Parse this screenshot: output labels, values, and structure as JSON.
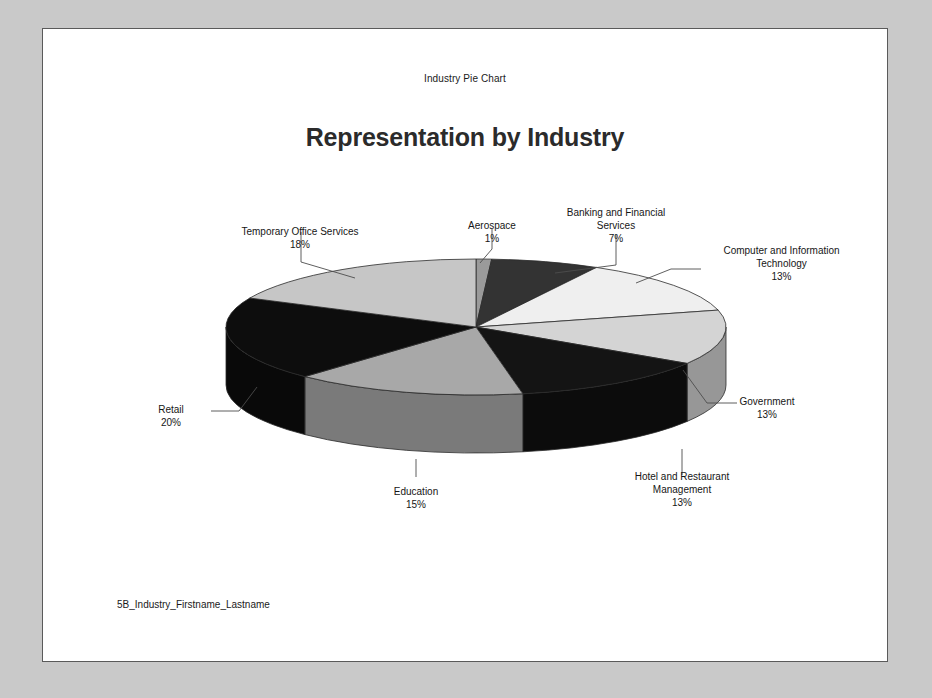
{
  "document": {
    "header": "Industry Pie Chart",
    "title": "Representation by Industry",
    "footer": "5B_Industry_Firstname_Lastname"
  },
  "chart_data": {
    "type": "pie",
    "title": "Representation by Industry",
    "subtitle": "Industry Pie Chart",
    "style": "3d-exploded-disc",
    "legend": "none",
    "labels_show_percent": true,
    "categories": [
      "Aerospace",
      "Banking and Financial Services",
      "Computer and Information Technology",
      "Government",
      "Hotel and Restaurant Management",
      "Education",
      "Retail",
      "Temporary Office Services"
    ],
    "values": [
      1,
      7,
      13,
      13,
      13,
      15,
      20,
      18
    ],
    "percent_labels": [
      "1%",
      "7%",
      "13%",
      "13%",
      "13%",
      "15%",
      "20%",
      "18%"
    ],
    "colors": [
      "#9a9a9a",
      "#333333",
      "#efefef",
      "#d4d4d4",
      "#141414",
      "#a8a8a8",
      "#0d0d0d",
      "#c6c6c6"
    ],
    "side_colors": [
      "#6e6e6e",
      "#242424",
      "#b0b0b0",
      "#979797",
      "#0c0c0c",
      "#7a7a7a",
      "#090909",
      "#8e8e8e"
    ]
  },
  "labels": [
    {
      "name": "Aerospace",
      "text": "Aerospace",
      "pct": "1%"
    },
    {
      "name": "Banking",
      "line1": "Banking and Financial",
      "line2": "Services",
      "pct": "7%"
    },
    {
      "name": "Computer",
      "line1": "Computer and Information",
      "line2": "Technology",
      "pct": "13%"
    },
    {
      "name": "Government",
      "text": "Government",
      "pct": "13%"
    },
    {
      "name": "Hotel",
      "line1": "Hotel and Restaurant",
      "line2": "Management",
      "pct": "13%"
    },
    {
      "name": "Education",
      "text": "Education",
      "pct": "15%"
    },
    {
      "name": "Retail",
      "text": "Retail",
      "pct": "20%"
    },
    {
      "name": "Temporary",
      "text": "Temporary Office Services",
      "pct": "18%"
    }
  ]
}
